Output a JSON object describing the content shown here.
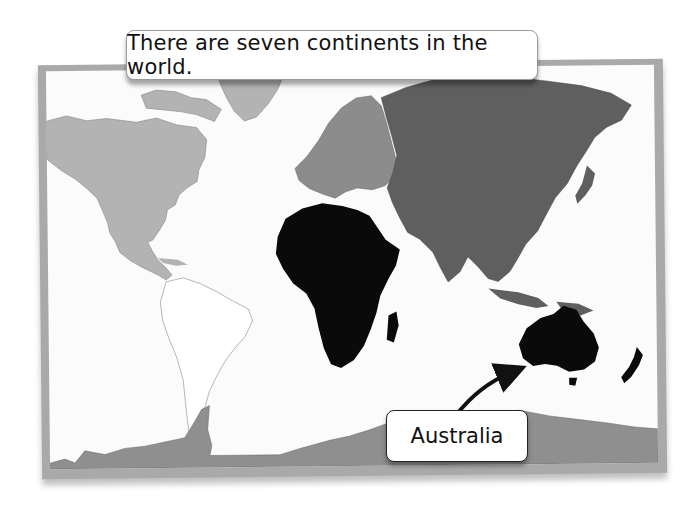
{
  "title": "There are seven continents in the world.",
  "callout": {
    "label": "Australia",
    "target": "australia"
  },
  "continents": [
    {
      "name": "North America",
      "fill": "#b3b3b3"
    },
    {
      "name": "South America",
      "fill": "#ffffff"
    },
    {
      "name": "Europe",
      "fill": "#8c8c8c"
    },
    {
      "name": "Asia",
      "fill": "#5f5f5f"
    },
    {
      "name": "Africa",
      "fill": "#0a0a0a"
    },
    {
      "name": "Australia",
      "fill": "#0a0a0a"
    },
    {
      "name": "Antarctica",
      "fill": "#8f8f8f"
    }
  ]
}
